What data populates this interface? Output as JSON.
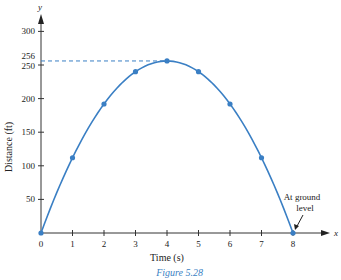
{
  "chart_data": {
    "type": "line",
    "title": "",
    "caption": "Figure 5.28",
    "xlabel": "Time (s)",
    "ylabel": "Distance (ft)",
    "x_axis_letter": "x",
    "y_axis_letter": "y",
    "x": [
      0,
      1,
      2,
      3,
      4,
      5,
      6,
      7,
      8
    ],
    "values": [
      0,
      112,
      192,
      240,
      256,
      240,
      192,
      112,
      0
    ],
    "xticks": [
      "0",
      "1",
      "2",
      "3",
      "4",
      "5",
      "6",
      "7",
      "8"
    ],
    "yticks": [
      "50",
      "100",
      "150",
      "200",
      "250",
      "256",
      "300"
    ],
    "xlim": [
      0,
      8.5
    ],
    "ylim": [
      0,
      320
    ],
    "grid": false,
    "reference_line": {
      "y": 256,
      "style": "dashed",
      "from_x": 0,
      "to_x": 4
    },
    "annotation": {
      "text_line1": "At ground",
      "text_line2": "level",
      "points_to": [
        8,
        0
      ]
    },
    "line_color": "#3a7fc4"
  }
}
